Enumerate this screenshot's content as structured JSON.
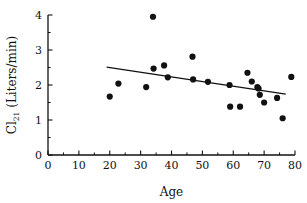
{
  "chart_data": {
    "type": "scatter",
    "title": "",
    "xlabel": "Age",
    "ylabel": "Cl",
    "ylabel_subscript": "21",
    "ylabel_units": "(Liters/min)",
    "ylabel_full": "Cl21 (Liters/min)",
    "xlim": [
      0,
      80
    ],
    "ylim": [
      0,
      4
    ],
    "xticks": [
      0,
      10,
      20,
      30,
      40,
      50,
      60,
      70,
      80
    ],
    "yticks": [
      0,
      1,
      2,
      3,
      4
    ],
    "xticklabels": [
      "0",
      "10",
      "20",
      "30",
      "40",
      "50",
      "60",
      "70",
      "80"
    ],
    "yticklabels": [
      "0",
      "1",
      "2",
      "3",
      "4"
    ],
    "x_minor_step": 5,
    "y_minor_step": 0.5,
    "grid": false,
    "legend": false,
    "marker": "filled-circle",
    "marker_color": "#111111",
    "points": [
      {
        "x": 20.0,
        "y": 1.67
      },
      {
        "x": 22.8,
        "y": 2.04
      },
      {
        "x": 31.8,
        "y": 1.94
      },
      {
        "x": 34.0,
        "y": 3.95
      },
      {
        "x": 34.2,
        "y": 2.47
      },
      {
        "x": 37.6,
        "y": 2.56
      },
      {
        "x": 38.8,
        "y": 2.22
      },
      {
        "x": 46.8,
        "y": 2.81
      },
      {
        "x": 47.0,
        "y": 2.16
      },
      {
        "x": 51.8,
        "y": 2.09
      },
      {
        "x": 58.8,
        "y": 2.0
      },
      {
        "x": 59.0,
        "y": 1.38
      },
      {
        "x": 62.2,
        "y": 1.38
      },
      {
        "x": 64.6,
        "y": 2.35
      },
      {
        "x": 66.0,
        "y": 2.1
      },
      {
        "x": 67.8,
        "y": 1.94
      },
      {
        "x": 68.2,
        "y": 1.9
      },
      {
        "x": 68.6,
        "y": 1.72
      },
      {
        "x": 70.0,
        "y": 1.5
      },
      {
        "x": 74.2,
        "y": 1.63
      },
      {
        "x": 76.0,
        "y": 1.05
      },
      {
        "x": 78.8,
        "y": 2.23
      }
    ],
    "trendline": {
      "label": "linear regression fit",
      "x_start": 19.0,
      "y_start": 2.51,
      "x_end": 77.0,
      "y_end": 1.74,
      "color": "#111111"
    }
  }
}
